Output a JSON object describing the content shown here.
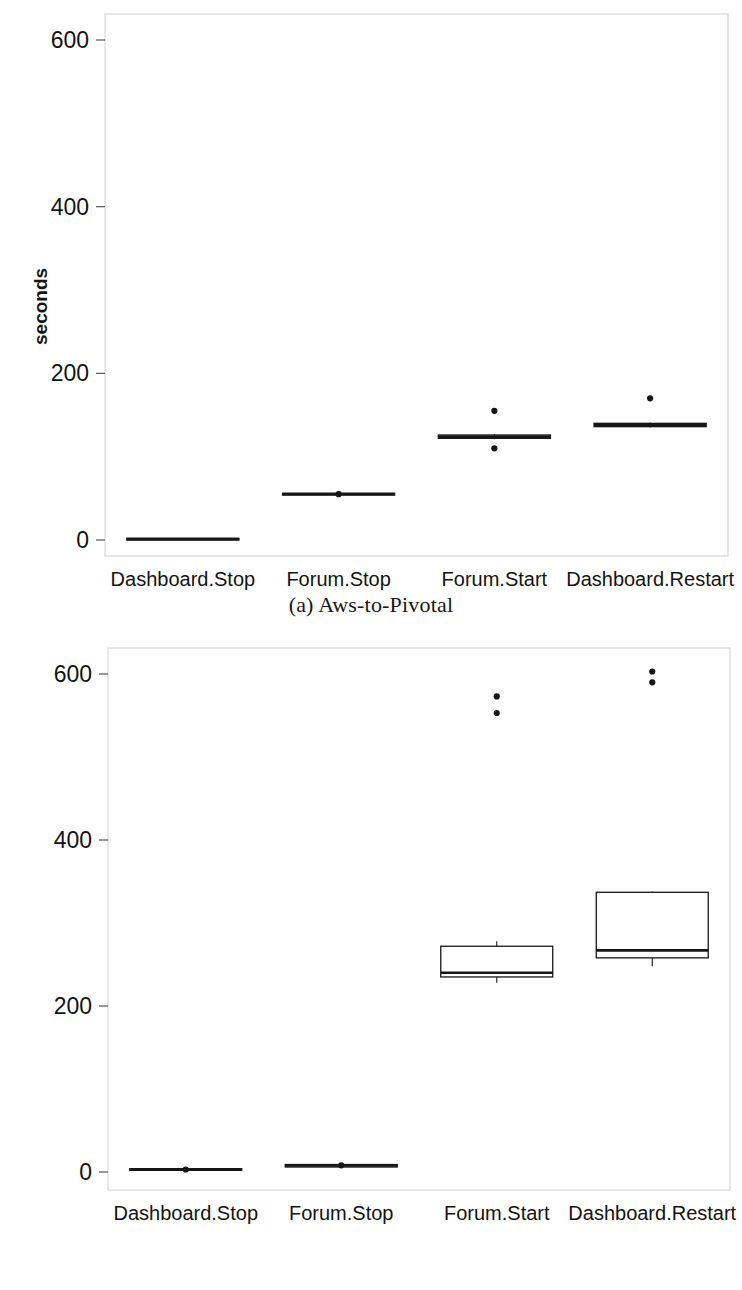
{
  "figures": [
    {
      "id": "a",
      "caption": "(a) Aws-to-Pivotal",
      "ylabel": "seconds",
      "yticks": [
        "0",
        "200",
        "400",
        "600"
      ],
      "xticks": [
        "Dashboard.Stop",
        "Forum.Stop",
        "Forum.Start",
        "Dashboard.Restart"
      ]
    },
    {
      "id": "b",
      "caption": "(b) Pivotal-to-Aws",
      "ylabel": "seconds",
      "yticks": [
        "0",
        "200",
        "400",
        "600"
      ],
      "xticks": [
        "Dashboard.Stop",
        "Forum.Stop",
        "Forum.Start",
        "Dashboard.Restart"
      ]
    }
  ],
  "chart_data": [
    {
      "type": "box",
      "title": "(a) Aws-to-Pivotal",
      "xlabel": "",
      "ylabel": "seconds",
      "ylim": [
        0,
        648
      ],
      "yticks": [
        0,
        200,
        400,
        600
      ],
      "grid": false,
      "legend": "none",
      "categories": [
        "Dashboard.Stop",
        "Forum.Stop",
        "Forum.Start",
        "Dashboard.Restart"
      ],
      "boxes": [
        {
          "category": "Dashboard.Stop",
          "whisker_low": 0,
          "q1": 0,
          "median": 1,
          "q3": 2,
          "whisker_high": 2,
          "outliers": []
        },
        {
          "category": "Forum.Stop",
          "whisker_low": 53,
          "q1": 54,
          "median": 55,
          "q3": 56,
          "whisker_high": 57,
          "outliers": [
            55
          ]
        },
        {
          "category": "Forum.Start",
          "whisker_low": 121,
          "q1": 122,
          "median": 124,
          "q3": 126,
          "whisker_high": 127,
          "outliers": [
            155,
            110
          ]
        },
        {
          "category": "Dashboard.Restart",
          "whisker_low": 135,
          "q1": 136,
          "median": 138,
          "q3": 140,
          "whisker_high": 141,
          "outliers": [
            170
          ]
        }
      ]
    },
    {
      "type": "box",
      "title": "(b) Pivotal-to-Aws",
      "xlabel": "",
      "ylabel": "seconds",
      "ylim": [
        0,
        648
      ],
      "yticks": [
        0,
        200,
        400,
        600
      ],
      "grid": false,
      "legend": "none",
      "categories": [
        "Dashboard.Stop",
        "Forum.Stop",
        "Forum.Start",
        "Dashboard.Restart"
      ],
      "boxes": [
        {
          "category": "Dashboard.Stop",
          "whisker_low": 2,
          "q1": 2,
          "median": 3,
          "q3": 4,
          "whisker_high": 5,
          "outliers": [
            3
          ]
        },
        {
          "category": "Forum.Stop",
          "whisker_low": 5,
          "q1": 6,
          "median": 8,
          "q3": 9,
          "whisker_high": 10,
          "outliers": [
            8
          ]
        },
        {
          "category": "Forum.Start",
          "whisker_low": 228,
          "q1": 235,
          "median": 240,
          "q3": 272,
          "whisker_high": 278,
          "outliers": [
            553,
            573
          ]
        },
        {
          "category": "Dashboard.Restart",
          "whisker_low": 248,
          "q1": 258,
          "median": 267,
          "q3": 337,
          "whisker_high": 338,
          "outliers": [
            590,
            603
          ]
        }
      ]
    }
  ],
  "style": {
    "line_color": "#161616",
    "frame_color": "#d7d7d7",
    "background": "#ffffff"
  }
}
